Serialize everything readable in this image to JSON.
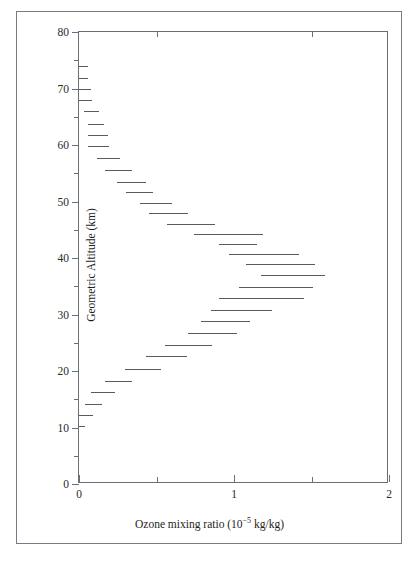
{
  "figure": {
    "background_color": "#ffffff",
    "frame_color": "#7a7a84",
    "axis_color": "#6d6d75",
    "data_color": "#59595f"
  },
  "chart_data": {
    "type": "bar",
    "orientation": "horizontal-step",
    "title": "",
    "xlabel": "Ozone mixing ratio (10−5 kg/kg)",
    "xlabel_base": "Ozone mixing ratio (10",
    "xlabel_exponent": "−5",
    "xlabel_tail": " kg/kg)",
    "ylabel": "Geometric Altitude (km)",
    "xlim": [
      0,
      2
    ],
    "ylim": [
      0,
      80
    ],
    "xticks": [
      0,
      1,
      2
    ],
    "xticklabels": [
      "0",
      "1",
      "2"
    ],
    "xticks_minor": [
      0.5,
      1.5
    ],
    "yticks": [
      0,
      10,
      20,
      30,
      40,
      50,
      60,
      70,
      80
    ],
    "yticklabels": [
      "0",
      "10",
      "20",
      "30",
      "40",
      "50",
      "60",
      "70",
      "80"
    ],
    "yticks_minor": [
      5,
      15,
      25,
      35,
      45,
      55,
      65,
      75
    ],
    "grid": false,
    "legend": false,
    "series_name": "Ozone mixing ratio profile",
    "note": "Each datum is a horizontal segment spanning an ozone-mixing-ratio interval at a fixed altitude (step/histogram profile).",
    "bars": [
      {
        "altitude_km": 74.0,
        "x_start": 0.0,
        "x_end": 0.055
      },
      {
        "altitude_km": 71.8,
        "x_start": 0.0,
        "x_end": 0.06
      },
      {
        "altitude_km": 70.0,
        "x_start": 0.0,
        "x_end": 0.075
      },
      {
        "altitude_km": 68.0,
        "x_start": 0.0,
        "x_end": 0.085
      },
      {
        "altitude_km": 66.0,
        "x_start": 0.035,
        "x_end": 0.13
      },
      {
        "altitude_km": 63.7,
        "x_start": 0.055,
        "x_end": 0.16
      },
      {
        "altitude_km": 61.8,
        "x_start": 0.06,
        "x_end": 0.185
      },
      {
        "altitude_km": 59.8,
        "x_start": 0.06,
        "x_end": 0.195
      },
      {
        "altitude_km": 57.7,
        "x_start": 0.115,
        "x_end": 0.265
      },
      {
        "altitude_km": 55.5,
        "x_start": 0.165,
        "x_end": 0.34
      },
      {
        "altitude_km": 53.5,
        "x_start": 0.245,
        "x_end": 0.43
      },
      {
        "altitude_km": 51.6,
        "x_start": 0.3,
        "x_end": 0.475
      },
      {
        "altitude_km": 49.7,
        "x_start": 0.395,
        "x_end": 0.6
      },
      {
        "altitude_km": 47.9,
        "x_start": 0.45,
        "x_end": 0.7
      },
      {
        "altitude_km": 46.1,
        "x_start": 0.565,
        "x_end": 0.875
      },
      {
        "altitude_km": 44.2,
        "x_start": 0.745,
        "x_end": 1.185
      },
      {
        "altitude_km": 42.5,
        "x_start": 0.9,
        "x_end": 1.15
      },
      {
        "altitude_km": 40.7,
        "x_start": 0.965,
        "x_end": 1.42
      },
      {
        "altitude_km": 39.0,
        "x_start": 1.08,
        "x_end": 1.52
      },
      {
        "altitude_km": 37.0,
        "x_start": 1.175,
        "x_end": 1.59
      },
      {
        "altitude_km": 34.9,
        "x_start": 1.035,
        "x_end": 1.51
      },
      {
        "altitude_km": 33.0,
        "x_start": 0.905,
        "x_end": 1.45
      },
      {
        "altitude_km": 30.8,
        "x_start": 0.85,
        "x_end": 1.245
      },
      {
        "altitude_km": 28.9,
        "x_start": 0.79,
        "x_end": 1.105
      },
      {
        "altitude_km": 26.8,
        "x_start": 0.705,
        "x_end": 1.02
      },
      {
        "altitude_km": 24.6,
        "x_start": 0.555,
        "x_end": 0.86
      },
      {
        "altitude_km": 22.7,
        "x_start": 0.435,
        "x_end": 0.7
      },
      {
        "altitude_km": 20.4,
        "x_start": 0.295,
        "x_end": 0.53
      },
      {
        "altitude_km": 18.3,
        "x_start": 0.17,
        "x_end": 0.34
      },
      {
        "altitude_km": 16.3,
        "x_start": 0.08,
        "x_end": 0.23
      },
      {
        "altitude_km": 14.2,
        "x_start": 0.04,
        "x_end": 0.15
      },
      {
        "altitude_km": 12.2,
        "x_start": 0.0,
        "x_end": 0.09
      },
      {
        "altitude_km": 10.2,
        "x_start": 0.0,
        "x_end": 0.04
      }
    ]
  }
}
